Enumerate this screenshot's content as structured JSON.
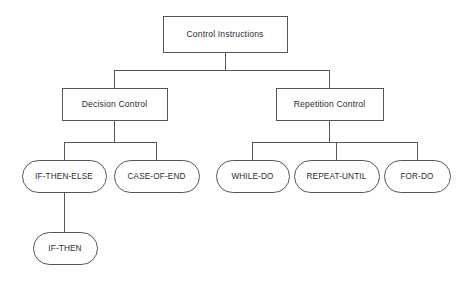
{
  "diagram": {
    "type": "tree-diagram",
    "background_color": "#ffffff",
    "stroke_color": "#555555",
    "text_color": "#2b2b2b",
    "nodes": [
      {
        "id": "control-instructions",
        "label": "Control Instructions",
        "shape": "rectangle",
        "level": 0,
        "x": 163,
        "y": 16,
        "width": 124,
        "height": 36
      },
      {
        "id": "decision-control",
        "label": "Decision Control",
        "shape": "rectangle",
        "level": 1,
        "x": 62,
        "y": 88,
        "width": 105,
        "height": 32
      },
      {
        "id": "repetition-control",
        "label": "Repetition Control",
        "shape": "rectangle",
        "level": 1,
        "x": 276,
        "y": 88,
        "width": 107,
        "height": 32
      },
      {
        "id": "if-then-else",
        "label": "IF-THEN-ELSE",
        "shape": "capsule",
        "level": 2,
        "x": 22,
        "y": 160,
        "width": 84,
        "height": 32
      },
      {
        "id": "case-of-end",
        "label": "CASE-OF-END",
        "shape": "capsule",
        "level": 2,
        "x": 114,
        "y": 160,
        "width": 85,
        "height": 32
      },
      {
        "id": "while-do",
        "label": "WHILE-DO",
        "shape": "capsule",
        "level": 2,
        "x": 216,
        "y": 160,
        "width": 73,
        "height": 32
      },
      {
        "id": "repeat-until",
        "label": "REPEAT-UNTIL",
        "shape": "capsule",
        "level": 2,
        "x": 294,
        "y": 160,
        "width": 85,
        "height": 32
      },
      {
        "id": "for-do",
        "label": "FOR-DO",
        "shape": "capsule",
        "level": 2,
        "x": 384,
        "y": 160,
        "width": 66,
        "height": 32
      },
      {
        "id": "if-then",
        "label": "IF-THEN",
        "shape": "capsule",
        "level": 3,
        "x": 33,
        "y": 232,
        "width": 64,
        "height": 32
      }
    ],
    "edges": [
      {
        "from": "control-instructions",
        "to": "decision-control"
      },
      {
        "from": "control-instructions",
        "to": "repetition-control"
      },
      {
        "from": "decision-control",
        "to": "if-then-else"
      },
      {
        "from": "decision-control",
        "to": "case-of-end"
      },
      {
        "from": "repetition-control",
        "to": "while-do"
      },
      {
        "from": "repetition-control",
        "to": "repeat-until"
      },
      {
        "from": "repetition-control",
        "to": "for-do"
      },
      {
        "from": "if-then-else",
        "to": "if-then"
      }
    ],
    "connectors": [
      {
        "id": "root-stem",
        "d": "M 225 52 L 225 70"
      },
      {
        "id": "root-bus",
        "d": "M 114.5 70 L 329.5 70"
      },
      {
        "id": "root-to-decision",
        "d": "M 114.5 70 L 114.5 88"
      },
      {
        "id": "root-to-repetition",
        "d": "M 329.5 70 L 329.5 88"
      },
      {
        "id": "decision-stem",
        "d": "M 114.5 120 L 114.5 142"
      },
      {
        "id": "decision-bus",
        "d": "M 64 142 L 156.5 142"
      },
      {
        "id": "decision-to-ite",
        "d": "M 64 142 L 64 160"
      },
      {
        "id": "decision-to-case",
        "d": "M 156.5 142 L 156.5 160"
      },
      {
        "id": "repetition-stem",
        "d": "M 329.5 120 L 329.5 142"
      },
      {
        "id": "repetition-bus",
        "d": "M 252.5 142 L 417 142"
      },
      {
        "id": "repetition-to-while",
        "d": "M 252.5 142 L 252.5 160"
      },
      {
        "id": "repetition-to-repeat",
        "d": "M 336.5 142 L 336.5 160"
      },
      {
        "id": "repetition-to-for",
        "d": "M 417 142 L 417 160"
      },
      {
        "id": "ite-to-ifthen",
        "d": "M 64 192 L 64 232"
      }
    ]
  }
}
